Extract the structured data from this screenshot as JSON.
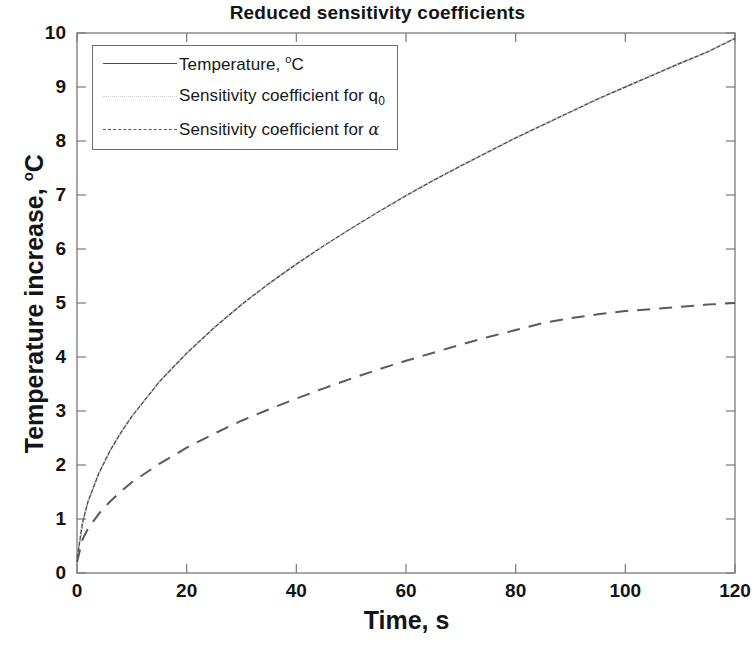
{
  "chart_data": {
    "type": "line",
    "title": "Reduced sensitivity coefficients",
    "xlabel": "Time, s",
    "ylabel": "Temperature increase, °C",
    "xlim": [
      0,
      120
    ],
    "ylim": [
      0,
      10
    ],
    "xticks": [
      0,
      20,
      40,
      60,
      80,
      100,
      120
    ],
    "yticks": [
      0,
      1,
      2,
      3,
      4,
      5,
      6,
      7,
      8,
      9,
      10
    ],
    "xtick_labels": [
      "0",
      "20",
      "40",
      "60",
      "80",
      "100",
      "120"
    ],
    "ytick_labels": [
      "0",
      "1",
      "2",
      "3",
      "4",
      "5",
      "6",
      "7",
      "8",
      "9",
      "10"
    ],
    "grid": false,
    "legend_position": "upper left",
    "series": [
      {
        "name": "Temperature, °C",
        "style": "solid",
        "color": "#4a4a4a",
        "x": [
          0,
          1,
          2,
          4,
          6,
          8,
          10,
          15,
          20,
          25,
          30,
          35,
          40,
          45,
          50,
          55,
          60,
          65,
          70,
          75,
          80,
          85,
          90,
          95,
          100,
          105,
          110,
          115,
          120
        ],
        "y": [
          0.25,
          0.93,
          1.32,
          1.85,
          2.26,
          2.6,
          2.9,
          3.54,
          4.07,
          4.54,
          4.97,
          5.36,
          5.72,
          6.06,
          6.38,
          6.69,
          6.99,
          7.27,
          7.54,
          7.8,
          8.06,
          8.3,
          8.54,
          8.78,
          9.0,
          9.22,
          9.44,
          9.65,
          9.9
        ]
      },
      {
        "name": "Sensitivity coefficient for q_0",
        "style": "dotted",
        "color": "#cfcfcf",
        "x": [
          0,
          1,
          2,
          4,
          6,
          8,
          10,
          15,
          20,
          25,
          30,
          35,
          40,
          45,
          50,
          55,
          60,
          65,
          70,
          75,
          80,
          85,
          90,
          95,
          100,
          105,
          110,
          115,
          120
        ],
        "y": [
          0.25,
          0.93,
          1.32,
          1.85,
          2.26,
          2.6,
          2.9,
          3.54,
          4.07,
          4.54,
          4.97,
          5.36,
          5.72,
          6.06,
          6.38,
          6.69,
          6.99,
          7.27,
          7.54,
          7.8,
          8.06,
          8.3,
          8.54,
          8.78,
          9.0,
          9.22,
          9.44,
          9.65,
          9.9
        ]
      },
      {
        "name": "Sensitivity coefficient for alpha",
        "style": "dashed",
        "color": "#5a5a5a",
        "x": [
          0,
          1,
          2,
          4,
          6,
          8,
          10,
          15,
          20,
          25,
          30,
          35,
          40,
          45,
          50,
          55,
          60,
          65,
          70,
          75,
          80,
          85,
          90,
          95,
          100,
          105,
          110,
          115,
          120
        ],
        "y": [
          0.2,
          0.62,
          0.82,
          1.1,
          1.32,
          1.51,
          1.68,
          2.02,
          2.32,
          2.58,
          2.82,
          3.03,
          3.23,
          3.42,
          3.6,
          3.77,
          3.93,
          4.08,
          4.23,
          4.37,
          4.5,
          4.63,
          4.72,
          4.79,
          4.85,
          4.89,
          4.93,
          4.97,
          5.0
        ]
      }
    ]
  },
  "legend": {
    "entries": [
      {
        "label_main": "Temperature, ",
        "sup": "o",
        "label_tail": "C",
        "sub": "",
        "greek": "",
        "style": "solid"
      },
      {
        "label_main": "Sensitivity  coefficient for q",
        "sup": "",
        "label_tail": "",
        "sub": "0",
        "greek": "",
        "style": "dotted"
      },
      {
        "label_main": "Sensitivity  coefficient for ",
        "sup": "",
        "label_tail": "",
        "sub": "",
        "greek": "α",
        "style": "dashed"
      }
    ]
  },
  "axes": {
    "title": "Reduced sensitivity coefficients",
    "xlabel": "Time, s",
    "ylabel_main": "Temperature increase, ",
    "ylabel_sup": "o",
    "ylabel_tail": "C"
  }
}
